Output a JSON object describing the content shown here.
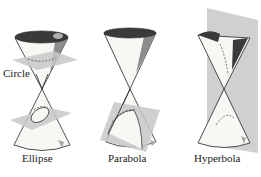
{
  "figure": {
    "panels": [
      {
        "name": "ellipse",
        "label": "Ellipse",
        "extra_label": "Circle"
      },
      {
        "name": "parabola",
        "label": "Parabola"
      },
      {
        "name": "hyperbola",
        "label": "Hyperbola"
      }
    ],
    "colors": {
      "background": "#ffffff",
      "cone_fill": "#f7f7f4",
      "cone_dark": "#3a3a3a",
      "cone_shade": "#8c8c8c",
      "plane": "#c8c8c8",
      "line": "#222222"
    }
  }
}
